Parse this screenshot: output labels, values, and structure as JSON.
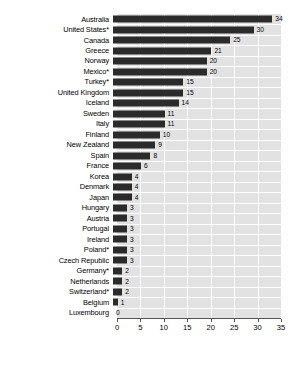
{
  "chart_data": {
    "type": "bar",
    "orientation": "horizontal",
    "title": "",
    "subtitle": "",
    "xlabel": "",
    "ylabel": "",
    "xlim": [
      0,
      35
    ],
    "xticks": [
      0,
      5,
      10,
      15,
      20,
      25,
      30,
      35
    ],
    "grid": true,
    "legend": "none",
    "bar_color": "#2b2b2b",
    "plot_background": "#e2e2e2",
    "gridline_color": "#ffffff",
    "categories": [
      "Australia",
      "United States*",
      "Canada",
      "Greece",
      "Norway",
      "Mexico*",
      "Turkey*",
      "United Kingdom",
      "Iceland",
      "Sweden",
      "Italy",
      "Finland",
      "New Zealand",
      "Spain",
      "France",
      "Korea",
      "Denmark",
      "Japan",
      "Hungary",
      "Austria",
      "Portugal",
      "Ireland",
      "Poland*",
      "Czech Republic",
      "Germany*",
      "Netherlands",
      "Switzerland*",
      "Belgium",
      "Luxembourg"
    ],
    "values": [
      34,
      30,
      25,
      21,
      20,
      20,
      15,
      15,
      14,
      11,
      11,
      10,
      9,
      8,
      6,
      4,
      4,
      4,
      3,
      3,
      3,
      3,
      3,
      3,
      2,
      2,
      2,
      1,
      0
    ],
    "value_labels": [
      "34",
      "30",
      "25",
      "21",
      "20",
      "20",
      "15",
      "15",
      "14",
      "11",
      "11",
      "10",
      "9",
      "8",
      "6",
      "4",
      "4",
      "4",
      "3",
      "3",
      "3",
      "3",
      "3",
      "3",
      "2",
      "2",
      "2",
      "1",
      "0"
    ]
  }
}
